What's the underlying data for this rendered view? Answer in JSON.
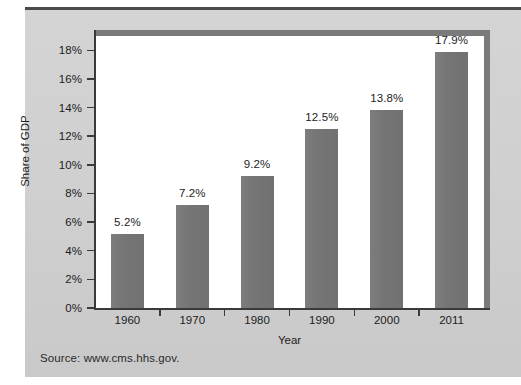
{
  "figure": {
    "source_note": "Source: www.cms.hhs.gov.",
    "panel_color": "#d2d2d2",
    "bar_color": "#777777",
    "plot_background": "#ffffff",
    "axis_color": "#3a3a3a",
    "frame_color": "#7a7a7a"
  },
  "chart_data": {
    "type": "bar",
    "title": "",
    "subtitle": "",
    "xlabel": "Year",
    "ylabel": "Share of GDP",
    "categories": [
      "1960",
      "1970",
      "1980",
      "1990",
      "2000",
      "2011"
    ],
    "values": [
      5.2,
      7.2,
      9.2,
      12.5,
      13.8,
      17.9
    ],
    "data_labels": [
      "5.2%",
      "7.2%",
      "9.2%",
      "12.5%",
      "13.8%",
      "17.9%"
    ],
    "ylim": [
      0,
      19
    ],
    "yticks": [
      0,
      2,
      4,
      6,
      8,
      10,
      12,
      14,
      16,
      18
    ],
    "ytick_labels": [
      "0%",
      "2%",
      "4%",
      "6%",
      "8%",
      "10%",
      "12%",
      "14%",
      "16%",
      "18%"
    ],
    "grid": false,
    "legend": false,
    "legend_position": "none",
    "units": "percent"
  }
}
